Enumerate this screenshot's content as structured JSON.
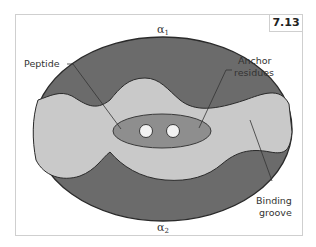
{
  "figure": {
    "number": "7.13",
    "labels": {
      "alpha1": "α",
      "alpha1_sub": "1",
      "alpha2": "α",
      "alpha2_sub": "2",
      "peptide": "Peptide",
      "anchor_line1": "Anchor",
      "anchor_line2": "residues",
      "groove_line1": "Binding",
      "groove_line2": "groove"
    },
    "colors": {
      "helix_dark": "#6b6b6b",
      "groove_light": "#c9c9c9",
      "peptide_mid": "#8e8e8e",
      "anchor_white": "#f2f2f2",
      "outline": "#2a2a2a"
    }
  }
}
